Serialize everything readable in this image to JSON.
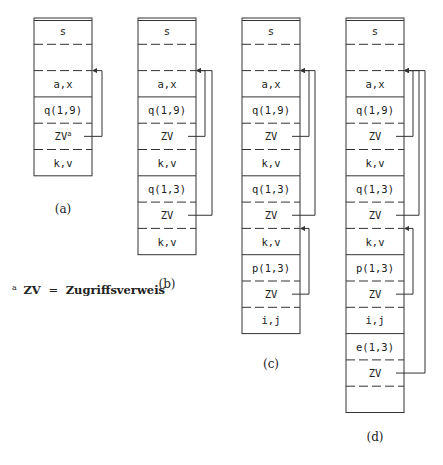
{
  "diagram": {
    "row_height": 26.3,
    "top": 18,
    "box_width": 58,
    "stroke_color": "#333333",
    "columns": [
      {
        "id": "a",
        "caption": "(a)",
        "x": 34,
        "caption_y": 213,
        "rows": [
          {
            "label": "s",
            "sep_below": "dashed"
          },
          {
            "label": "",
            "sep_below": "dashed"
          },
          {
            "label": "a,x",
            "sep_below": "solid"
          },
          {
            "label": "q(1,9)",
            "sep_below": "dashed"
          },
          {
            "label": "ZV",
            "sup": "a",
            "sep_below": "dashed"
          },
          {
            "label": "k,v",
            "sep_below": "end"
          }
        ],
        "links": [
          {
            "from_row": 4,
            "to_row": 2,
            "offset": 10
          }
        ]
      },
      {
        "id": "b",
        "caption": "(b)",
        "x": 138,
        "caption_y": 288,
        "rows": [
          {
            "label": "s",
            "sep_below": "dashed"
          },
          {
            "label": "",
            "sep_below": "dashed"
          },
          {
            "label": "a,x",
            "sep_below": "solid"
          },
          {
            "label": "q(1,9)",
            "sep_below": "dashed"
          },
          {
            "label": "ZV",
            "sep_below": "dashed"
          },
          {
            "label": "k,v",
            "sep_below": "solid"
          },
          {
            "label": "q(1,3)",
            "sep_below": "dashed"
          },
          {
            "label": "ZV",
            "sep_below": "dashed"
          },
          {
            "label": "k,v",
            "sep_below": "end"
          }
        ],
        "links": [
          {
            "from_row": 4,
            "to_row": 2,
            "offset": 9
          },
          {
            "from_row": 7,
            "to_row": 2,
            "offset": 16
          }
        ]
      },
      {
        "id": "c",
        "caption": "(c)",
        "x": 242,
        "caption_y": 368,
        "rows": [
          {
            "label": "s",
            "sep_below": "dashed"
          },
          {
            "label": "",
            "sep_below": "dashed"
          },
          {
            "label": "a,x",
            "sep_below": "solid"
          },
          {
            "label": "q(1,9)",
            "sep_below": "dashed"
          },
          {
            "label": "ZV",
            "sep_below": "dashed"
          },
          {
            "label": "k,v",
            "sep_below": "solid"
          },
          {
            "label": "q(1,3)",
            "sep_below": "dashed"
          },
          {
            "label": "ZV",
            "sep_below": "dashed"
          },
          {
            "label": "k,v",
            "sep_below": "solid"
          },
          {
            "label": "p(1,3)",
            "sep_below": "dashed"
          },
          {
            "label": "ZV",
            "sep_below": "dashed"
          },
          {
            "label": "i,j",
            "sep_below": "end"
          }
        ],
        "links": [
          {
            "from_row": 4,
            "to_row": 2,
            "offset": 9
          },
          {
            "from_row": 7,
            "to_row": 2,
            "offset": 15
          },
          {
            "from_row": 10,
            "to_row": 8,
            "offset": 9
          }
        ]
      },
      {
        "id": "d",
        "caption": "(d)",
        "x": 346,
        "caption_y": 441,
        "rows": [
          {
            "label": "s",
            "sep_below": "dashed"
          },
          {
            "label": "",
            "sep_below": "dashed"
          },
          {
            "label": "a,x",
            "sep_below": "solid"
          },
          {
            "label": "q(1,9)",
            "sep_below": "dashed"
          },
          {
            "label": "ZV",
            "sep_below": "dashed"
          },
          {
            "label": "k,v",
            "sep_below": "solid"
          },
          {
            "label": "q(1,3)",
            "sep_below": "dashed"
          },
          {
            "label": "ZV",
            "sep_below": "dashed"
          },
          {
            "label": "k,v",
            "sep_below": "solid"
          },
          {
            "label": "p(1,3)",
            "sep_below": "dashed"
          },
          {
            "label": "ZV",
            "sep_below": "dashed"
          },
          {
            "label": "i,j",
            "sep_below": "solid"
          },
          {
            "label": "e(1,3)",
            "sep_below": "dashed"
          },
          {
            "label": "ZV",
            "sep_below": "dashed"
          },
          {
            "label": "",
            "sep_below": "end"
          }
        ],
        "links": [
          {
            "from_row": 4,
            "to_row": 2,
            "offset": 9
          },
          {
            "from_row": 7,
            "to_row": 2,
            "offset": 15
          },
          {
            "from_row": 13,
            "to_row": 2,
            "offset": 21
          },
          {
            "from_row": 10,
            "to_row": 8,
            "offset": 9
          }
        ]
      }
    ],
    "footnote": {
      "marker": "a",
      "term": "ZV",
      "equals": "=",
      "definition": "Zugriffsverweis",
      "x": 12,
      "y": 294
    }
  }
}
